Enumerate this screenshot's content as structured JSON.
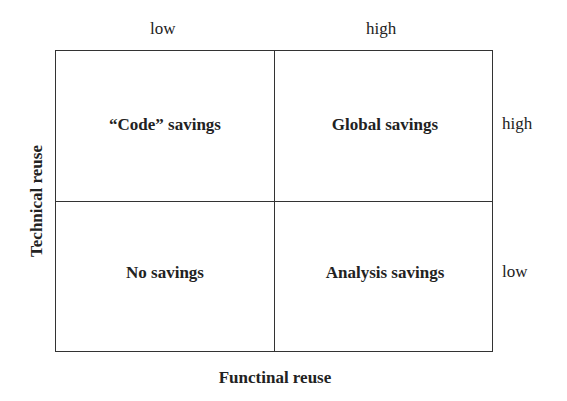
{
  "diagram": {
    "type": "2x2 matrix",
    "x_axis": {
      "label": "Functinal reuse",
      "ticks": [
        "low",
        "high"
      ]
    },
    "y_axis": {
      "label": "Technical reuse",
      "ticks": [
        "high",
        "low"
      ]
    },
    "quadrants": {
      "top_left": "“Code” savings",
      "top_right": "Global savings",
      "bottom_left": "No savings",
      "bottom_right": "Analysis savings"
    },
    "colors": {
      "line": "#333333",
      "text": "#222222",
      "background": "#ffffff"
    }
  }
}
